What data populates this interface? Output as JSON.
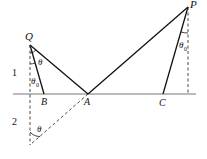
{
  "diagram": {
    "title": "",
    "points": {
      "Q": {
        "label": "Q",
        "x": 30,
        "y": 45
      },
      "B": {
        "label": "B",
        "x": 44,
        "y": 94
      },
      "A": {
        "label": "A",
        "x": 88,
        "y": 94
      },
      "C": {
        "label": "C",
        "x": 163,
        "y": 94
      },
      "P": {
        "label": "P",
        "x": 188,
        "y": 7
      },
      "Q_image": {
        "label": "",
        "x": 30,
        "y": 145
      }
    },
    "media": [
      {
        "label": "1"
      },
      {
        "label": "2"
      }
    ],
    "angles": {
      "theta": "θ",
      "theta0_sym": "θ",
      "theta0_sub": "0"
    },
    "colors": {
      "line": "#111111",
      "interface": "#666666"
    }
  }
}
